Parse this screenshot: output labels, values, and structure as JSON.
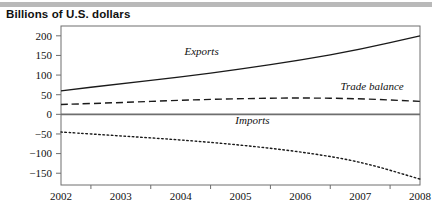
{
  "figure": {
    "title": "Billions of U.S. dollars"
  },
  "chart_data": {
    "type": "line",
    "title": "Billions of U.S. dollars",
    "xlabel": "",
    "ylabel": "Billions of U.S. dollars",
    "x": [
      2002,
      2003,
      2004,
      2005,
      2006,
      2007,
      2008
    ],
    "xlim": [
      2002,
      2008
    ],
    "ylim": [
      -180,
      225
    ],
    "yticks": [
      200,
      150,
      100,
      50,
      0,
      -50,
      -100,
      -150
    ],
    "ytick_labels": [
      "200",
      "150",
      "100",
      "50",
      "0",
      "−50",
      "−100",
      "−150"
    ],
    "xtick_labels": [
      "2002",
      "2003",
      "2004",
      "2005",
      "2006",
      "2007",
      "2008"
    ],
    "grid": false,
    "legend": "inline-annotations",
    "zero_line": true,
    "series": [
      {
        "name": "Exports",
        "style": "solid",
        "color": "#1a1a1a",
        "values": [
          60,
          78,
          95,
          115,
          138,
          165,
          200
        ],
        "label_x": 2004.35,
        "label_y": 152
      },
      {
        "name": "Trade balance",
        "style": "dashed",
        "color": "#1a1a1a",
        "values": [
          25,
          30,
          36,
          40,
          42,
          40,
          33
        ],
        "label_x": 2007.2,
        "label_y": 62
      },
      {
        "name": "Imports",
        "style": "dotted",
        "color": "#1a1a1a",
        "values": [
          -45,
          -55,
          -65,
          -78,
          -95,
          -120,
          -165
        ],
        "label_x": 2005.2,
        "label_y": -25
      }
    ]
  }
}
